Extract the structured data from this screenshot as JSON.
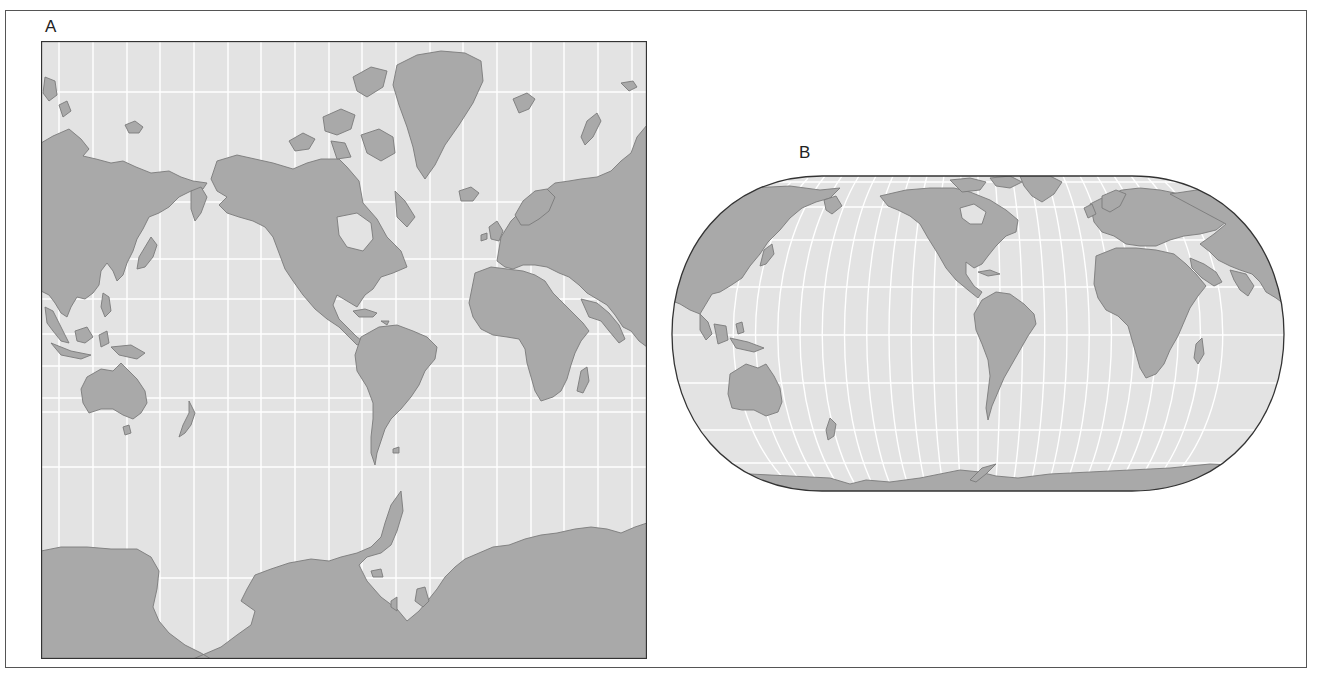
{
  "figure": {
    "panels": [
      {
        "label": "A",
        "projection": "Mercator (rectangular, square)",
        "description": "World map with straight equally spaced meridians and parallels spaced increasingly toward poles; Antarctica greatly enlarged along bottom",
        "colors": {
          "ocean": "#e3e3e3",
          "land": "#a9a9a9",
          "coastline": "#7b7b7b",
          "graticule": "#ffffff",
          "border": "#333333"
        }
      },
      {
        "label": "B",
        "projection": "Eckert IV (pseudocylindrical, rounded sides, flat poles)",
        "description": "World map with curved meridians and straight parallels; Americas centered",
        "colors": {
          "ocean": "#e3e3e3",
          "land": "#a9a9a9",
          "coastline": "#7b7b7b",
          "graticule": "#ffffff",
          "border": "#333333"
        }
      }
    ]
  }
}
